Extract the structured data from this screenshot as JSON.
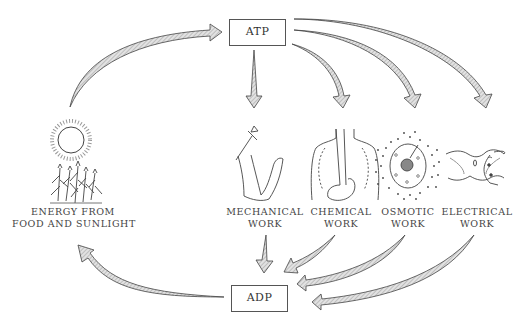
{
  "diagram": {
    "nodes": {
      "atp": {
        "label": "ATP"
      },
      "adp": {
        "label": "ADP"
      },
      "source": {
        "line1": "ENERGY FROM",
        "line2": "FOOD AND SUNLIGHT",
        "icon": "sun-and-plants-icon"
      }
    },
    "work_types": [
      {
        "line1": "MECHANICAL",
        "line2": "WORK",
        "icon": "arm-with-hammer-icon"
      },
      {
        "line1": "CHEMICAL",
        "line2": "WORK",
        "icon": "torso-organs-icon"
      },
      {
        "line1": "OSMOTIC",
        "line2": "WORK",
        "icon": "cell-with-particles-icon"
      },
      {
        "line1": "ELECTRICAL",
        "line2": "WORK",
        "icon": "nerve-cell-icon"
      }
    ],
    "edges": [
      {
        "from": "source",
        "to": "atp"
      },
      {
        "from": "atp",
        "to": "mechanical"
      },
      {
        "from": "atp",
        "to": "chemical"
      },
      {
        "from": "atp",
        "to": "osmotic"
      },
      {
        "from": "atp",
        "to": "electrical"
      },
      {
        "from": "mechanical",
        "to": "adp"
      },
      {
        "from": "chemical",
        "to": "adp"
      },
      {
        "from": "osmotic",
        "to": "adp"
      },
      {
        "from": "electrical",
        "to": "adp"
      },
      {
        "from": "adp",
        "to": "source"
      }
    ],
    "colors": {
      "line": "#444444",
      "arrow_fill": "#c8c8c8",
      "background": "#ffffff"
    }
  }
}
